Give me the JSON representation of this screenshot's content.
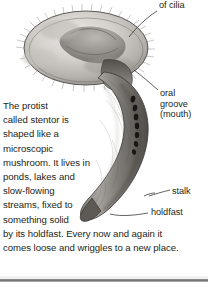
{
  "figure": {
    "background_color": "#ffffff",
    "ink_color": "#231f20",
    "labels": [
      {
        "id": "cilia",
        "text": "of cilia",
        "name": "label-ring-of-cilia"
      },
      {
        "id": "oral",
        "text": "oral\ngroove\n(mouth)",
        "lines": [
          "oral",
          "groove",
          "(mouth)"
        ],
        "name": "label-oral-groove"
      },
      {
        "id": "stalk",
        "text": "stalk",
        "name": "label-stalk"
      },
      {
        "id": "holdfast",
        "text": "holdfast",
        "name": "label-holdfast"
      }
    ]
  },
  "caption": {
    "lines": [
      "The protist",
      "called stentor is",
      "shaped like a",
      "microscopic",
      "mushroom. It lives in",
      "ponds, lakes and",
      "slow-flowing",
      "streams, fixed to",
      "something solid",
      "by its holdfast. Every now and again it",
      "comes loose and wriggles to a new place."
    ]
  },
  "colors": {
    "organism_light": "#d8d6d2",
    "organism_mid": "#9a9691",
    "organism_dark": "#5e5a56",
    "nucleus": "#1b1a19",
    "rule": "#6f6f6f"
  }
}
